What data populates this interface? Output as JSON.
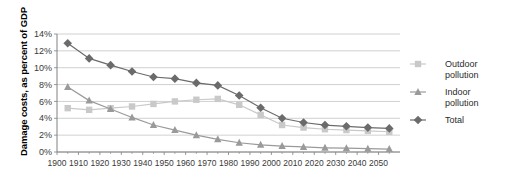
{
  "chart_data": {
    "type": "line",
    "title": "",
    "xlabel": "",
    "ylabel": "Damage costs, as percent of GDP",
    "xlim": [
      1900,
      2060
    ],
    "ylim": [
      0,
      14
    ],
    "ytick_labels": [
      "0%",
      "2%",
      "4%",
      "6%",
      "8%",
      "10%",
      "12%",
      "14%"
    ],
    "ytick_values": [
      0,
      2,
      4,
      6,
      8,
      10,
      12,
      14
    ],
    "xtick_labels": [
      "1900",
      "1910",
      "1920",
      "1930",
      "1940",
      "1950",
      "1960",
      "1970",
      "1980",
      "1990",
      "2000",
      "2010",
      "2020",
      "2030",
      "2040",
      "2050"
    ],
    "xtick_values": [
      1900,
      1910,
      1920,
      1930,
      1940,
      1950,
      1960,
      1970,
      1980,
      1990,
      2000,
      2010,
      2020,
      2030,
      2040,
      2050
    ],
    "x": [
      1905,
      1915,
      1925,
      1935,
      1945,
      1955,
      1965,
      1975,
      1985,
      1995,
      2005,
      2015,
      2025,
      2035,
      2045,
      2055
    ],
    "grid": "horizontal",
    "legend_position": "right",
    "series": [
      {
        "name": "Outdoor pollution",
        "marker": "square",
        "color": "#c9c9c9",
        "values": [
          5.2,
          5.0,
          5.2,
          5.4,
          5.7,
          6.0,
          6.2,
          6.3,
          5.6,
          4.4,
          3.2,
          2.9,
          2.7,
          2.6,
          2.5,
          2.4
        ]
      },
      {
        "name": "Indoor pollution",
        "marker": "triangle",
        "color": "#9a9a9a",
        "values": [
          7.7,
          6.1,
          5.1,
          4.1,
          3.2,
          2.6,
          2.0,
          1.5,
          1.1,
          0.85,
          0.7,
          0.6,
          0.5,
          0.45,
          0.4,
          0.35
        ]
      },
      {
        "name": "Total",
        "marker": "diamond",
        "color": "#6b6b6b",
        "values": [
          12.9,
          11.1,
          10.3,
          9.55,
          8.9,
          8.7,
          8.2,
          7.9,
          6.7,
          5.25,
          4.0,
          3.5,
          3.2,
          3.05,
          2.9,
          2.8
        ]
      }
    ]
  },
  "legend": {
    "items": [
      {
        "label_line1": "Outdoor",
        "label_line2": "pollution"
      },
      {
        "label_line1": "Indoor",
        "label_line2": "pollution"
      },
      {
        "label_line1": "Total",
        "label_line2": ""
      }
    ]
  },
  "colors": {
    "gridline": "#c4c4c4",
    "axis": "#808080",
    "outdoor": "#c9c9c9",
    "indoor": "#9a9a9a",
    "total": "#6b6b6b",
    "text": "#2b2b2b",
    "background": "#ffffff"
  }
}
